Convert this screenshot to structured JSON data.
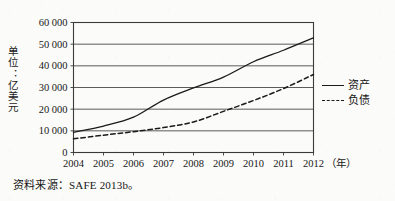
{
  "chart_data": {
    "type": "line",
    "title": "",
    "xlabel": "（年）",
    "ylabel": "单位：亿美元",
    "x": [
      2004,
      2005,
      2006,
      2007,
      2008,
      2009,
      2010,
      2011,
      2012
    ],
    "xticklabels": [
      "2004",
      "2005",
      "2006",
      "2007",
      "2008",
      "2009",
      "2010",
      "2011",
      "2012"
    ],
    "yticklabels": [
      "0",
      "10 000",
      "20 000",
      "30 000",
      "40 000",
      "50 000",
      "60 000"
    ],
    "ytickvalues": [
      0,
      10000,
      20000,
      30000,
      40000,
      50000,
      60000
    ],
    "ylim": [
      0,
      60000
    ],
    "xlim": [
      2004,
      2012
    ],
    "grid": "horizontal",
    "legend_position": "right",
    "series": [
      {
        "name": "资产",
        "style": "solid",
        "color": "#1a1a1a",
        "values": [
          9300,
          12200,
          16300,
          24200,
          29800,
          34800,
          41900,
          47200,
          52900
        ]
      },
      {
        "name": "负债",
        "style": "dashed",
        "color": "#1a1a1a",
        "values": [
          6300,
          8000,
          9600,
          11500,
          14100,
          19000,
          24000,
          29500,
          36000
        ]
      }
    ],
    "source": "资料来源：SAFE 2013b。"
  },
  "axis": {
    "y_title": "单位：亿美元",
    "x_unit_label": "（年）"
  },
  "legend": {
    "items": [
      {
        "label": "资产",
        "style": "solid"
      },
      {
        "label": "负债",
        "style": "dashed"
      }
    ]
  },
  "note": {
    "source": "资料来源：SAFE 2013b。"
  },
  "colors": {
    "line": "#1a1a1a",
    "grid": "#4a4a4a",
    "frame": "#3a3a3a",
    "background": "#fbfbf9"
  }
}
